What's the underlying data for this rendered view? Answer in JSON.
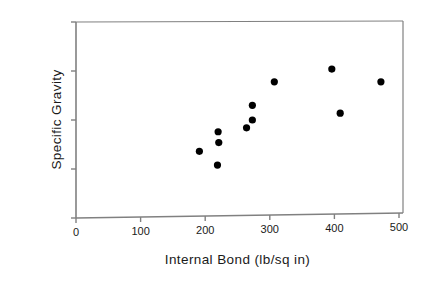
{
  "chart_data": {
    "type": "scatter",
    "title": "",
    "xlabel": "Internal  Bond  (lb/sq in)",
    "ylabel": "Specific  Gravity",
    "xlim": [
      0,
      500
    ],
    "ylim": [
      0.9,
      1.1
    ],
    "xticks": [
      0,
      100,
      200,
      300,
      400,
      500
    ],
    "xtick_labels": [
      "0",
      "100",
      "200",
      "300",
      "400",
      "500"
    ],
    "yticks": [
      0.9,
      0.95,
      1.0,
      1.05,
      1.1
    ],
    "ytick_labels": [
      "0.9",
      "0.95",
      "1",
      "1.05",
      "1.1"
    ],
    "grid": false,
    "legend": null,
    "marker": {
      "shape": "filled-circle",
      "color": "#000000",
      "size_px": 6
    },
    "axes_color": "#808080",
    "points": [
      {
        "x": 191,
        "y": 0.968
      },
      {
        "x": 220,
        "y": 0.988
      },
      {
        "x": 221,
        "y": 0.977
      },
      {
        "x": 219,
        "y": 0.954
      },
      {
        "x": 264,
        "y": 0.992
      },
      {
        "x": 273,
        "y": 1.015
      },
      {
        "x": 273,
        "y": 1.0
      },
      {
        "x": 307,
        "y": 1.039
      },
      {
        "x": 396,
        "y": 1.052
      },
      {
        "x": 409,
        "y": 1.007
      },
      {
        "x": 472,
        "y": 1.039
      }
    ]
  }
}
